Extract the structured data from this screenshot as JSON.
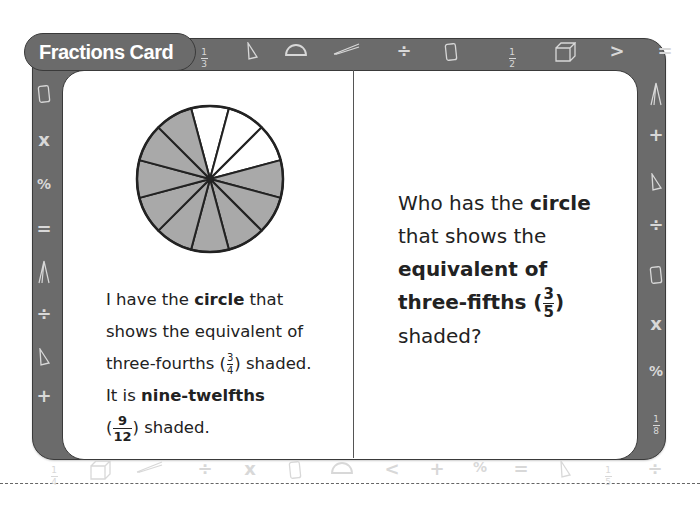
{
  "card": {
    "title": "Fractions Card",
    "left_panel": {
      "line1_pre": "I have the ",
      "line1_bold": "circle",
      "line1_post": " that",
      "line2": "shows the equivalent of",
      "line3_pre": "three-fourths (",
      "line3_frac_num": "3",
      "line3_frac_den": "4",
      "line3_post": ") shaded.",
      "line4_pre": "It is ",
      "line4_bold": "nine-twelfths",
      "line5_pre": "(",
      "line5_frac_num": "9",
      "line5_frac_den": "12",
      "line5_post": ") shaded."
    },
    "right_panel": {
      "line1_pre": "Who has the ",
      "line1_bold": "circle",
      "line2": "that shows the",
      "line3_bold": "equivalent of",
      "line4_bold": "three-fifths (",
      "line4_frac_num": "3",
      "line4_frac_den": "5",
      "line4_post": ")",
      "line5": "shaded?"
    },
    "pie": {
      "total_slices": 12,
      "shaded_slices": 9,
      "unshaded_slices": 3,
      "shaded_color": "#a9a9a9",
      "unshaded_color": "#ffffff"
    }
  },
  "border_symbols": {
    "top": [
      {
        "type": "fraction",
        "num": "1",
        "den": "3"
      },
      {
        "type": "icon",
        "name": "triangle"
      },
      {
        "type": "icon",
        "name": "protractor"
      },
      {
        "type": "icon",
        "name": "ruler"
      },
      {
        "type": "text",
        "value": "÷"
      },
      {
        "type": "icon",
        "name": "cylinder"
      },
      {
        "type": "fraction",
        "num": "1",
        "den": "2"
      },
      {
        "type": "icon",
        "name": "cube"
      },
      {
        "type": "text",
        "value": ">"
      },
      {
        "type": "text",
        "value": "="
      }
    ],
    "left": [
      {
        "type": "icon",
        "name": "cylinder"
      },
      {
        "type": "text",
        "value": "x"
      },
      {
        "type": "text",
        "value": "%"
      },
      {
        "type": "text",
        "value": "="
      },
      {
        "type": "icon",
        "name": "compass"
      },
      {
        "type": "text",
        "value": "÷"
      },
      {
        "type": "icon",
        "name": "triangle"
      },
      {
        "type": "text",
        "value": "+"
      }
    ],
    "right": [
      {
        "type": "icon",
        "name": "compass"
      },
      {
        "type": "text",
        "value": "+"
      },
      {
        "type": "icon",
        "name": "triangle"
      },
      {
        "type": "text",
        "value": "÷"
      },
      {
        "type": "icon",
        "name": "cylinder"
      },
      {
        "type": "text",
        "value": "x"
      },
      {
        "type": "text",
        "value": "%"
      },
      {
        "type": "fraction",
        "num": "1",
        "den": "8"
      }
    ],
    "bottom": [
      {
        "type": "fraction",
        "num": "1",
        "den": "4"
      },
      {
        "type": "icon",
        "name": "cube"
      },
      {
        "type": "icon",
        "name": "ruler"
      },
      {
        "type": "text",
        "value": "÷"
      },
      {
        "type": "text",
        "value": "x"
      },
      {
        "type": "icon",
        "name": "cylinder"
      },
      {
        "type": "icon",
        "name": "protractor"
      },
      {
        "type": "text",
        "value": "<"
      },
      {
        "type": "text",
        "value": "+"
      },
      {
        "type": "text",
        "value": "%"
      },
      {
        "type": "text",
        "value": "="
      },
      {
        "type": "icon",
        "name": "triangle"
      },
      {
        "type": "fraction",
        "num": "1",
        "den": "5"
      },
      {
        "type": "text",
        "value": "÷"
      }
    ]
  }
}
